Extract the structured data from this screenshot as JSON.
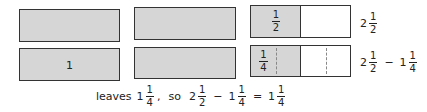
{
  "diagram": {
    "row1": {
      "bars": [
        {
          "label": ""
        },
        {
          "label": ""
        },
        {
          "left_label": {
            "num": "1",
            "den": "2"
          }
        }
      ],
      "result": {
        "whole": "2",
        "num": "1",
        "den": "2"
      }
    },
    "row2": {
      "bars": [
        {
          "label": "1"
        },
        {
          "label": ""
        },
        {
          "left_label": {
            "num": "1",
            "den": "4"
          }
        }
      ],
      "result": {
        "a": {
          "whole": "2",
          "num": "1",
          "den": "2"
        },
        "op": "−",
        "b": {
          "whole": "1",
          "num": "1",
          "den": "4"
        }
      }
    },
    "caption": {
      "prefix": "leaves",
      "leaves": {
        "whole": "1",
        "num": "1",
        "den": "4"
      },
      "comma": ",",
      "so": "so",
      "a": {
        "whole": "2",
        "num": "1",
        "den": "2"
      },
      "minus": "−",
      "b": {
        "whole": "1",
        "num": "1",
        "den": "4"
      },
      "equals": "=",
      "c": {
        "whole": "1",
        "num": "1",
        "den": "4"
      }
    },
    "colors": {
      "shaded": "#d6d6d6",
      "border": "#333333",
      "dashed": "#888888"
    }
  }
}
